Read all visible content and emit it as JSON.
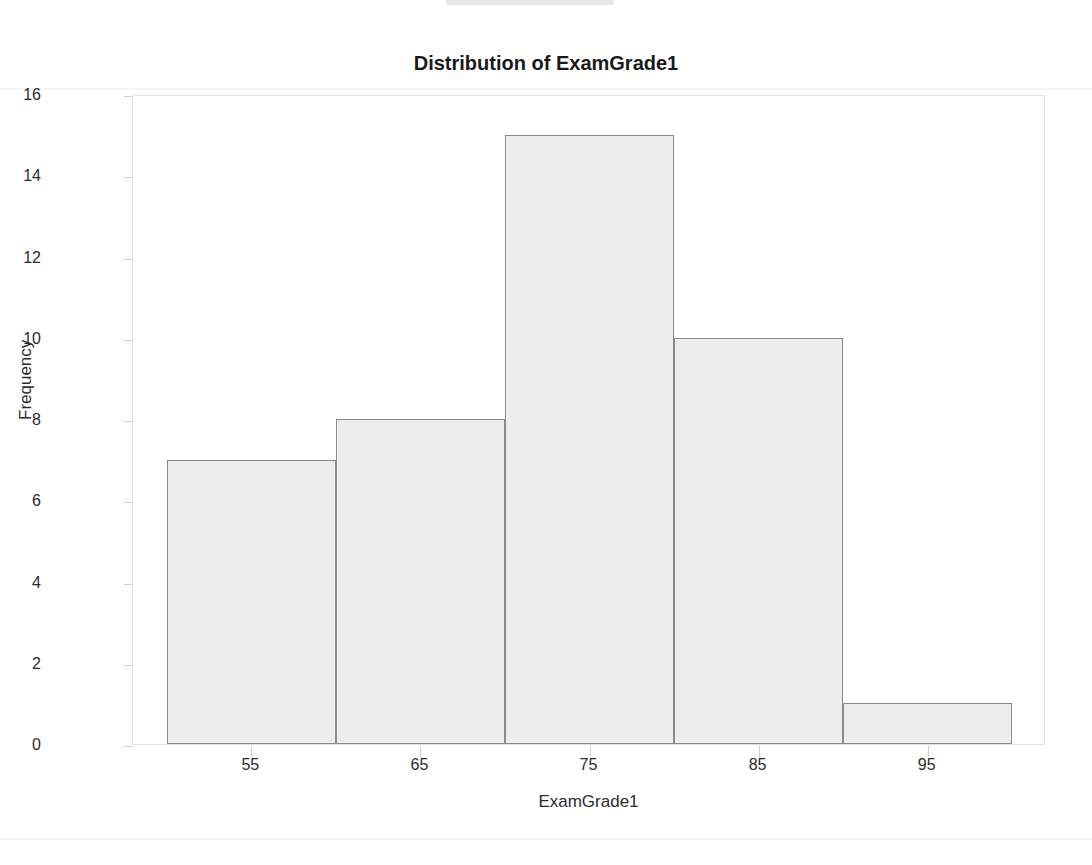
{
  "chart_data": {
    "type": "bar",
    "title": "Distribution of ExamGrade1",
    "xlabel": "ExamGrade1",
    "ylabel": "Frequency",
    "categories": [
      "50-60",
      "60-70",
      "70-80",
      "80-90",
      "90-100"
    ],
    "bin_edges": [
      50,
      60,
      70,
      80,
      90,
      100
    ],
    "bin_centers": [
      55,
      65,
      75,
      85,
      95
    ],
    "values": [
      7,
      8,
      15,
      10,
      1
    ],
    "xtick_labels": [
      "55",
      "65",
      "75",
      "85",
      "95"
    ],
    "ytick_labels": [
      "0",
      "2",
      "4",
      "6",
      "8",
      "10",
      "12",
      "14",
      "16"
    ],
    "ytick_values": [
      0,
      2,
      4,
      6,
      8,
      10,
      12,
      14,
      16
    ],
    "ylim": [
      0,
      16
    ],
    "xlim": [
      48,
      102
    ],
    "grid": false,
    "legend": "none",
    "bar_fill_color": "#ededed",
    "bar_border_color": "#8a8a8a",
    "frame_color": "#e3e3e3",
    "text_color": "#2b2b2b",
    "title_color": "#1a1a1a"
  }
}
